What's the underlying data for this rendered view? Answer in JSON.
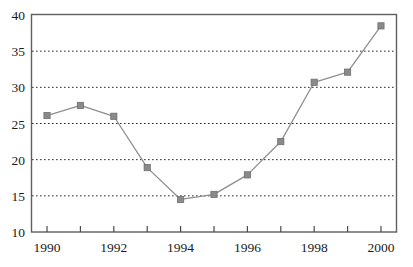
{
  "chart_data": {
    "type": "line",
    "title": "",
    "subtitle": "",
    "xlabel": "",
    "ylabel": "",
    "x": [
      1990,
      1991,
      1992,
      1993,
      1994,
      1995,
      1996,
      1997,
      1998,
      1999,
      2000
    ],
    "values": [
      26.1,
      27.5,
      26.0,
      18.9,
      14.5,
      15.2,
      17.9,
      22.5,
      30.7,
      32.1,
      38.5
    ],
    "series": [
      {
        "name": "",
        "values": [
          26.1,
          27.5,
          26.0,
          18.9,
          14.5,
          15.2,
          17.9,
          22.5,
          30.7,
          32.1,
          38.5
        ]
      }
    ],
    "xlim": [
      1989.55,
      2000.45
    ],
    "ylim": [
      10,
      40
    ],
    "yticks": [
      10,
      15,
      20,
      25,
      30,
      35,
      40
    ],
    "ytick_labels": [
      "10",
      "15",
      "20",
      "25",
      "30",
      "35",
      "40"
    ],
    "xticks": [
      1990,
      1991,
      1992,
      1993,
      1994,
      1995,
      1996,
      1997,
      1998,
      1999,
      2000
    ],
    "xtick_labels": [
      "1990",
      "",
      "1992",
      "",
      "1994",
      "",
      "1996",
      "",
      "1998",
      "",
      "2000"
    ],
    "xtick_labels_visible": [
      "1990",
      "1992",
      "1994",
      "1996",
      "1998",
      "2000"
    ],
    "grid": "horizontal-dotted",
    "gridlines_at": [
      15,
      20,
      25,
      30,
      35
    ],
    "legend": "none",
    "legend_position": "none",
    "marker": "square",
    "marker_color": "#8a8a8a",
    "line_color": "#8f8f8f",
    "frame_color": "#5f5f5f",
    "background_color": "#ffffff",
    "annotations": []
  }
}
